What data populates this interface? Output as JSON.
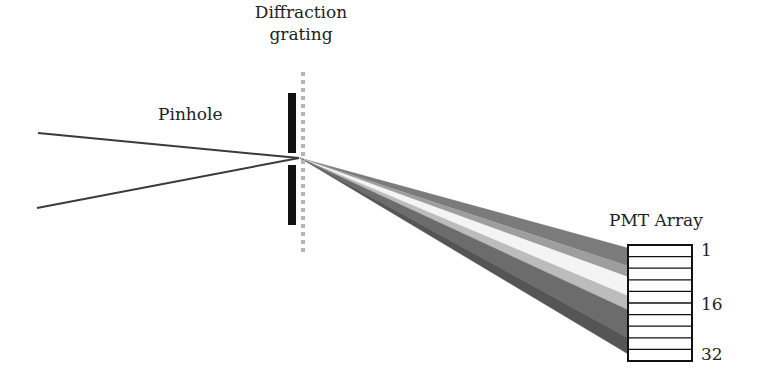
{
  "diagram": {
    "title_labels": {
      "grating_line1": "Diffraction",
      "grating_line2": "grating",
      "pinhole": "Pinhole",
      "pmt_array": "PMT Array"
    },
    "pmt_channel_labels": [
      "1",
      "16",
      "32"
    ],
    "pmt_rows": 10,
    "colors": {
      "line": "#3a3a3a",
      "pinhole_bar": "#111111",
      "grating_dots": "#b5b5b5",
      "pmt_border": "#111111",
      "beam_bands": [
        "#7b7b7b",
        "#9e9e9e",
        "#f4f4f4",
        "#bcbcbc",
        "#6c6c6c",
        "#555555"
      ]
    },
    "geometry": {
      "incoming_rays": [
        {
          "x1": 38,
          "y1": 133,
          "x2": 299,
          "y2": 158
        },
        {
          "x1": 37,
          "y1": 208,
          "x2": 299,
          "y2": 158
        }
      ],
      "pinhole_bars": [
        {
          "x": 288,
          "y": 93,
          "w": 8,
          "h": 60
        },
        {
          "x": 288,
          "y": 165,
          "w": 8,
          "h": 60
        }
      ],
      "grating": {
        "x": 303,
        "y1": 72,
        "y2": 250,
        "dot": 4,
        "gap": 8
      },
      "beam_origin": {
        "x": 300,
        "y": 158
      },
      "beam_end_x": 628,
      "beam_band_edges_at_end": [
        248,
        266,
        277,
        296,
        310,
        338,
        354
      ],
      "pmt_box": {
        "x": 628,
        "y": 245,
        "w": 64,
        "h": 116
      }
    }
  }
}
